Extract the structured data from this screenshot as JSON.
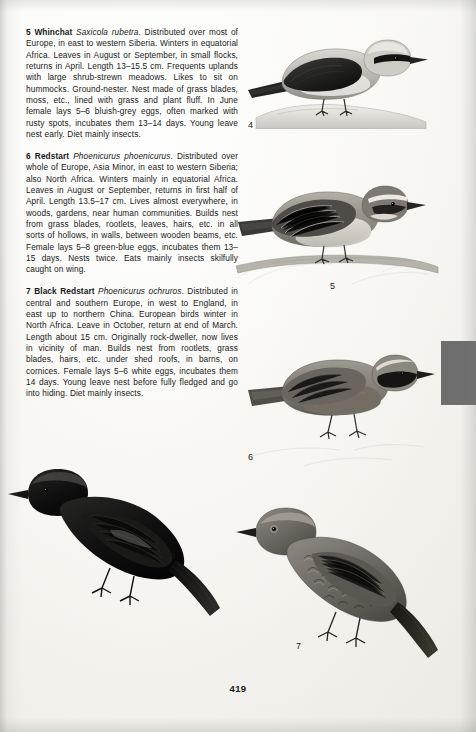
{
  "page": {
    "number": "419",
    "background_color": "#fbfbf9",
    "text_color": "#1a1a1a",
    "marker_bar_color": "#6e6e6e"
  },
  "entries": [
    {
      "number": "5",
      "common_name": "Whinchat",
      "latin_name": "Saxicola rubetra",
      "body": ". Distributed over most of Europe, in east to western Siberia. Winters in equatorial Africa. Leaves in August or September, in small flocks, returns in April. Length 13–15.5 cm. Frequents uplands with large shrub-strewn meadows. Likes to sit on hummocks. Ground-nester. Nest made of grass blades, moss, etc., lined with grass and plant fluff. In June female lays 5–6 bluish-grey eggs, often marked with rusty spots, incubates them 13–14 days. Young leave nest early. Diet mainly insects."
    },
    {
      "number": "6",
      "common_name": "Redstart",
      "latin_name": "Phoenicurus phoenicurus",
      "body": ". Distributed over whole of Europe, Asia Minor, in east to western Siberia; also North Africa. Winters mainly in equatorial Africa. Leaves in August or September, returns in first half of April. Length 13.5–17 cm. Lives almost everywhere, in woods, gardens, near human communities. Builds nest from grass blades, rootlets, leaves, hairs, etc. in all sorts of hollows, in walls, between wooden beams, etc. Female lays 5–8 green-blue eggs, incubates them 13–15 days. Nests twice. Eats mainly insects skilfully caught on wing."
    },
    {
      "number": "7",
      "common_name": "Black Redstart",
      "latin_name": "Phoenicurus ochruros",
      "body": ". Distributed in central and southern Europe, in west to England, in east up to northern China. European birds winter in North Africa. Leave in October, return at end of March. Length about 15 cm. Originally rock-dweller, now lives in vicinity of man. Builds nest from rootlets, grass blades, hairs, etc. under shed roofs, in barns, on cornices. Female lays 5–6 white eggs, incubates them 14 days. Young leave nest before fully fledged and go into hiding. Diet mainly insects."
    }
  ],
  "figure_labels": [
    {
      "id": "fig-4",
      "text": "4",
      "x": 248,
      "y": 120
    },
    {
      "id": "fig-5",
      "text": "5",
      "x": 330,
      "y": 281
    },
    {
      "id": "fig-6",
      "text": "6",
      "x": 248,
      "y": 452
    },
    {
      "id": "fig-3",
      "text": "3",
      "x": 170,
      "y": 551
    },
    {
      "id": "fig-7",
      "text": "7",
      "x": 296,
      "y": 641
    }
  ],
  "illustrations": [
    {
      "id": "plate-4",
      "caption_ref": "4",
      "subject": "wheatear-perched-on-rock"
    },
    {
      "id": "plate-5",
      "caption_ref": "5",
      "subject": "whinchat-perched-on-branch"
    },
    {
      "id": "plate-6",
      "caption_ref": "6",
      "subject": "redstart-male-perched"
    },
    {
      "id": "plate-3",
      "caption_ref": "3",
      "subject": "black-redstart-male-perched"
    },
    {
      "id": "plate-7",
      "caption_ref": "7",
      "subject": "black-redstart-female-perched"
    }
  ]
}
